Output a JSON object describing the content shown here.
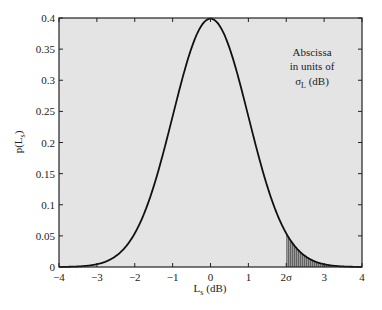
{
  "chart_data": {
    "type": "area",
    "title": "",
    "xlabel": "L_s (dB)",
    "ylabel": "p(L_s)",
    "xlim": [
      -4,
      4
    ],
    "ylim": [
      0,
      0.4
    ],
    "grid": false,
    "x_ticks": [
      -4,
      -3,
      -2,
      -1,
      0,
      1,
      2,
      3,
      4
    ],
    "x_tick_labels": [
      "−4",
      "−3",
      "−2",
      "−1",
      "0",
      "1",
      "2σ",
      "3",
      "4"
    ],
    "y_ticks": [
      0,
      0.05,
      0.1,
      0.15,
      0.2,
      0.25,
      0.3,
      0.35,
      0.4
    ],
    "y_tick_labels": [
      "0",
      "0.05",
      "0.1",
      "0.15",
      "0.2",
      "0.25",
      "0.3",
      "0.35",
      "0.4"
    ],
    "series": [
      {
        "name": "Gaussian PDF",
        "function": "standard normal, mean 0, sigma 1",
        "x": [
          -4,
          -3.5,
          -3,
          -2.5,
          -2,
          -1.5,
          -1,
          -0.5,
          0,
          0.5,
          1,
          1.5,
          2,
          2.5,
          3,
          3.5,
          4
        ],
        "values": [
          0.0001,
          0.0009,
          0.0044,
          0.0175,
          0.054,
          0.1295,
          0.242,
          0.3521,
          0.3989,
          0.3521,
          0.242,
          0.1295,
          0.054,
          0.0175,
          0.0044,
          0.0009,
          0.0001
        ]
      }
    ],
    "shaded_region": {
      "x_from": 2,
      "x_to": 4,
      "description": "tail area beyond 2σ"
    },
    "annotations": [
      "Abscissa",
      "in units of",
      "σL (dB)"
    ],
    "plot_background": "#e4e4e4",
    "curve_color": "#111111",
    "shade_color": "#7a7a7a"
  },
  "labels": {
    "xlabel_main": "L",
    "xlabel_sub": "s",
    "xlabel_unit": " (dB)",
    "ylabel_main": "p(L",
    "ylabel_sub": "s",
    "ylabel_end": ")",
    "annot_line1": "Abscissa",
    "annot_line2": "in units of",
    "annot_sigma": "σ",
    "annot_sigma_sub": "L",
    "annot_unit": " (dB)"
  }
}
